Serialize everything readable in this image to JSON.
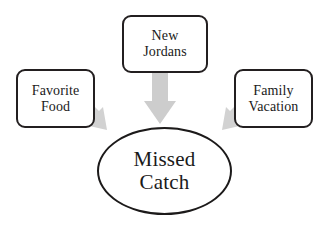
{
  "diagram": {
    "type": "cause-and-effect-arrow-diagram",
    "title_node": {
      "id": "missed-catch",
      "shape": "ellipse",
      "label_line_1": "Missed",
      "label_line_2": "Catch",
      "text_color": "#1a1a1a",
      "border_color": "#1c1a1a",
      "fill_color": "#ffffff"
    },
    "source_nodes": [
      {
        "id": "favorite-food",
        "shape": "rounded-rectangle",
        "position": "left",
        "label_line_1": "Favorite",
        "label_line_2": "Food",
        "border_color": "#231f20",
        "fill_color": "#ffffff",
        "text_color": "#1a1a1a"
      },
      {
        "id": "new-jordans",
        "shape": "rounded-rectangle",
        "position": "top-center",
        "label_line_1": "New",
        "label_line_2": "Jordans",
        "border_color": "#231f20",
        "fill_color": "#ffffff",
        "text_color": "#1a1a1a"
      },
      {
        "id": "family-vacation",
        "shape": "rounded-rectangle",
        "position": "right",
        "label_line_1": "Family",
        "label_line_2": "Vacation",
        "border_color": "#231f20",
        "fill_color": "#ffffff",
        "text_color": "#1a1a1a"
      }
    ],
    "arrows": [
      {
        "id": "arrow-favorite-food-to-missed-catch",
        "from": "favorite-food",
        "to": "missed-catch",
        "direction": "down-right",
        "fill_color": "#d2d2d2"
      },
      {
        "id": "arrow-new-jordans-to-missed-catch",
        "from": "new-jordans",
        "to": "missed-catch",
        "direction": "down",
        "fill_color": "#cccccc"
      },
      {
        "id": "arrow-family-vacation-to-missed-catch",
        "from": "family-vacation",
        "to": "missed-catch",
        "direction": "down-left",
        "fill_color": "#d2d2d2"
      }
    ],
    "background_color": "#ffffff"
  }
}
